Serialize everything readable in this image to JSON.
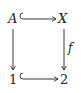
{
  "diagram": {
    "type": "commutative-square",
    "nodes": {
      "top_left": "A",
      "top_right": "X",
      "bottom_left": "1",
      "bottom_right": "2"
    },
    "arrows": [
      {
        "from": "A",
        "to": "X",
        "kind": "hook (inclusion)",
        "label": ""
      },
      {
        "from": "A",
        "to": "1",
        "kind": "plain",
        "label": ""
      },
      {
        "from": "X",
        "to": "2",
        "kind": "plain",
        "label": "f"
      },
      {
        "from": "1",
        "to": "2",
        "kind": "hook (inclusion)",
        "label": ""
      }
    ],
    "labels": {
      "right_arrow": "f"
    }
  }
}
